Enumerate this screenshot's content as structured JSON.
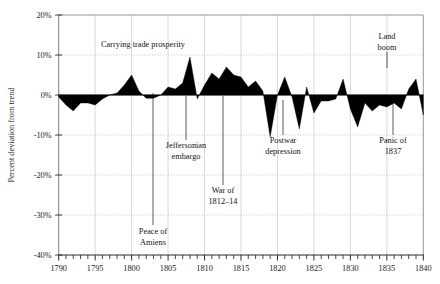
{
  "chart_data": {
    "type": "area",
    "title": "",
    "xlabel": "",
    "ylabel": "Percent deviation from trend",
    "xlim": [
      1790,
      1840
    ],
    "ylim": [
      -40,
      20
    ],
    "grid": true,
    "legend": "none",
    "y_ticks": [
      "20%",
      "10%",
      "0%",
      "-10%",
      "-20%",
      "-30%",
      "-40%"
    ],
    "y_tick_values": [
      20,
      10,
      0,
      -10,
      -20,
      -30,
      -40
    ],
    "x_ticks": [
      "1790",
      "1795",
      "1800",
      "1805",
      "1810",
      "1815",
      "1820",
      "1825",
      "1830",
      "1835",
      "1840"
    ],
    "x_tick_values": [
      1790,
      1795,
      1800,
      1805,
      1810,
      1815,
      1820,
      1825,
      1830,
      1835,
      1840
    ],
    "x_minor_tick_step": 1,
    "baseline": 0,
    "fill_color": "#000000",
    "x": [
      1790,
      1791,
      1792,
      1793,
      1794,
      1795,
      1796,
      1797,
      1798,
      1799,
      1800,
      1801,
      1802,
      1803,
      1804,
      1805,
      1806,
      1807,
      1808,
      1809,
      1810,
      1811,
      1812,
      1813,
      1814,
      1815,
      1816,
      1817,
      1818,
      1819,
      1820,
      1821,
      1822,
      1823,
      1824,
      1825,
      1826,
      1827,
      1828,
      1829,
      1830,
      1831,
      1832,
      1833,
      1834,
      1835,
      1836,
      1837,
      1838,
      1839,
      1840
    ],
    "values": [
      -0.5,
      -2.5,
      -4.0,
      -2.0,
      -2.0,
      -2.5,
      -1.0,
      0.0,
      0.5,
      2.5,
      5.0,
      1.0,
      -0.8,
      -0.8,
      0.0,
      2.0,
      1.5,
      3.0,
      9.5,
      -1.0,
      2.5,
      5.5,
      4.0,
      7.0,
      5.0,
      4.5,
      2.0,
      3.5,
      1.0,
      -10.5,
      0.0,
      4.5,
      -0.5,
      -8.5,
      2.0,
      -4.5,
      -1.5,
      -1.5,
      -1.0,
      4.0,
      -3.5,
      -8.0,
      -2.0,
      -4.0,
      -2.5,
      -3.0,
      -2.0,
      -3.5,
      1.5,
      4.0,
      -5.0
    ],
    "annotations": [
      {
        "id": "carrying-trade-prosperity",
        "lines": [
          "Carrying trade prosperity"
        ],
        "text_x": 143,
        "text_y": 47,
        "leader": null
      },
      {
        "id": "peace-of-amiens",
        "lines": [
          "Peace of",
          "Amiens"
        ],
        "text_x": 153,
        "text_y": 234,
        "leader": {
          "x": 153,
          "y1": 93,
          "y2": 225
        }
      },
      {
        "id": "jeffersonian-embargo",
        "lines": [
          "Jeffersonian",
          "embargo"
        ],
        "text_x": 186,
        "text_y": 148,
        "leader": {
          "x": 186,
          "y1": 96,
          "y2": 140
        }
      },
      {
        "id": "war-of-1812-14",
        "lines": [
          "War of",
          "1812–14"
        ],
        "text_x": 223,
        "text_y": 193,
        "leader": {
          "x": 223,
          "y1": 96,
          "y2": 185
        }
      },
      {
        "id": "postwar-depression",
        "lines": [
          "Postwar",
          "depression"
        ],
        "text_x": 283,
        "text_y": 143,
        "leader": {
          "x": 283,
          "y1": 100,
          "y2": 135
        }
      },
      {
        "id": "land-boom",
        "lines": [
          "Land",
          "boom"
        ],
        "text_x": 387,
        "text_y": 39,
        "leader": {
          "x": 387,
          "y1": 52,
          "y2": 68
        }
      },
      {
        "id": "panic-of-1837",
        "lines": [
          "Panic of",
          "1837"
        ],
        "text_x": 393,
        "text_y": 143,
        "leader": {
          "x": 393,
          "y1": 96,
          "y2": 135
        }
      }
    ]
  }
}
